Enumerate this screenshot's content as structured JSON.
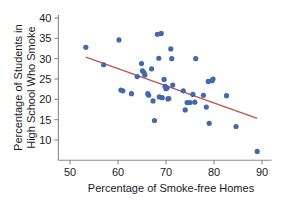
{
  "chart_data": {
    "type": "scatter",
    "title": "",
    "xlabel": "Percentage of Smoke-free Homes",
    "ylabel": "Percentage of Students in High School Who Smoke",
    "ylabel_line1": "Percentage of Students in",
    "ylabel_line2": "High School Who Smoke",
    "xlim": [
      48,
      92
    ],
    "ylim": [
      6,
      41
    ],
    "xticks": [
      50,
      60,
      70,
      80,
      90
    ],
    "yticks": [
      10,
      15,
      20,
      25,
      30,
      35,
      40
    ],
    "xtick_labels": [
      "50",
      "60",
      "70",
      "80",
      "90"
    ],
    "ytick_labels": [
      "10",
      "15",
      "20",
      "25",
      "30",
      "35",
      "40"
    ],
    "grid": false,
    "legend": "none",
    "marker_color": "#4268ae",
    "trend_color": "#c0504d",
    "points": [
      {
        "x": 53.3,
        "y": 32.8
      },
      {
        "x": 57.0,
        "y": 28.5
      },
      {
        "x": 60.2,
        "y": 34.6
      },
      {
        "x": 60.6,
        "y": 22.3
      },
      {
        "x": 61.0,
        "y": 22.1
      },
      {
        "x": 62.8,
        "y": 21.4
      },
      {
        "x": 64.0,
        "y": 25.6
      },
      {
        "x": 64.9,
        "y": 28.8
      },
      {
        "x": 65.1,
        "y": 27.0
      },
      {
        "x": 65.4,
        "y": 26.6
      },
      {
        "x": 65.6,
        "y": 26.0
      },
      {
        "x": 66.2,
        "y": 21.4
      },
      {
        "x": 66.4,
        "y": 21.0
      },
      {
        "x": 67.0,
        "y": 27.5
      },
      {
        "x": 67.3,
        "y": 19.6
      },
      {
        "x": 67.6,
        "y": 14.8
      },
      {
        "x": 68.2,
        "y": 36.0
      },
      {
        "x": 68.5,
        "y": 30.1
      },
      {
        "x": 68.6,
        "y": 20.6
      },
      {
        "x": 69.0,
        "y": 36.2
      },
      {
        "x": 69.2,
        "y": 20.4
      },
      {
        "x": 69.6,
        "y": 24.9
      },
      {
        "x": 69.8,
        "y": 23.2
      },
      {
        "x": 70.0,
        "y": 22.6
      },
      {
        "x": 70.2,
        "y": 22.8
      },
      {
        "x": 70.4,
        "y": 20.1
      },
      {
        "x": 70.6,
        "y": 20.2
      },
      {
        "x": 71.0,
        "y": 32.4
      },
      {
        "x": 71.2,
        "y": 30.0
      },
      {
        "x": 71.4,
        "y": 23.5
      },
      {
        "x": 73.6,
        "y": 22.1
      },
      {
        "x": 74.0,
        "y": 17.4
      },
      {
        "x": 74.4,
        "y": 19.2
      },
      {
        "x": 75.0,
        "y": 19.2
      },
      {
        "x": 75.6,
        "y": 21.2
      },
      {
        "x": 76.0,
        "y": 19.3
      },
      {
        "x": 76.2,
        "y": 30.0
      },
      {
        "x": 77.8,
        "y": 21.0
      },
      {
        "x": 78.4,
        "y": 18.1
      },
      {
        "x": 78.8,
        "y": 24.4
      },
      {
        "x": 79.0,
        "y": 14.1
      },
      {
        "x": 79.6,
        "y": 24.6
      },
      {
        "x": 79.8,
        "y": 25.0
      },
      {
        "x": 82.6,
        "y": 20.9
      },
      {
        "x": 84.6,
        "y": 13.3
      },
      {
        "x": 89.0,
        "y": 7.2
      }
    ],
    "trend_line": {
      "x_start": 53.3,
      "y_start": 30.4,
      "x_end": 89.0,
      "y_end": 15.3
    }
  }
}
